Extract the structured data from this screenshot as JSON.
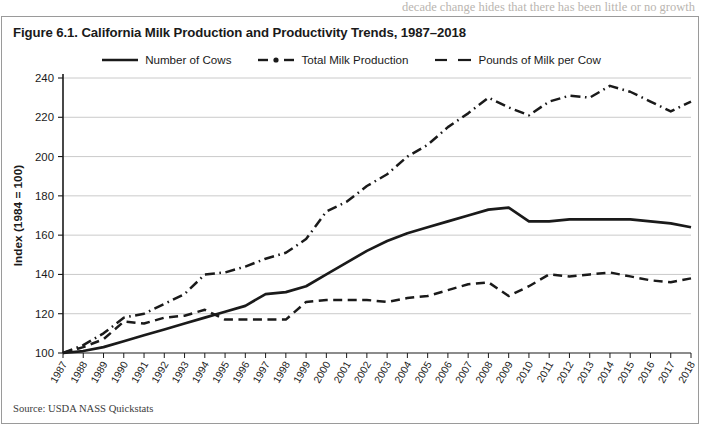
{
  "page_bleed_text": "decade change hides that there has been little or no growth",
  "figure": {
    "title": "Figure 6.1. California Milk Production and Productivity Trends, 1987–2018",
    "source": "Source: USDA NASS Quickstats",
    "border_color": "#9a9a9a",
    "background": "#ffffff"
  },
  "legend": {
    "position": "top-center",
    "items": [
      {
        "label": "Number of Cows",
        "style": "solid",
        "color": "#1a1a1a",
        "icon": "solid-line-swatch"
      },
      {
        "label": "Total Milk Production",
        "style": "dashdot",
        "color": "#1a1a1a",
        "icon": "dash-dot-line-swatch"
      },
      {
        "label": "Pounds of Milk per Cow",
        "style": "dashed",
        "color": "#1a1a1a",
        "icon": "dashed-line-swatch"
      }
    ]
  },
  "chart_data": {
    "type": "line",
    "title": "Figure 6.1. California Milk Production and Productivity Trends, 1987–2018",
    "xlabel": "",
    "ylabel": "Index (1984 = 100)",
    "ylim": [
      100,
      240
    ],
    "yticks": [
      100,
      120,
      140,
      160,
      180,
      200,
      220,
      240
    ],
    "grid": "horizontal",
    "legend_position": "top-center",
    "source": "Source: USDA NASS Quickstats",
    "categories": [
      "1987",
      "1988",
      "1989",
      "1990",
      "1991",
      "1992",
      "1993",
      "1994",
      "1995",
      "1996",
      "1997",
      "1998",
      "1999",
      "2000",
      "2001",
      "2002",
      "2003",
      "2004",
      "2005",
      "2006",
      "2007",
      "2008",
      "2009",
      "2010",
      "2011",
      "2012",
      "2013",
      "2014",
      "2015",
      "2016",
      "2017",
      "2018"
    ],
    "series": [
      {
        "name": "Number of Cows",
        "style": "solid",
        "color": "#1a1a1a",
        "values": [
          100,
          101,
          103,
          106,
          109,
          112,
          115,
          118,
          121,
          124,
          130,
          131,
          134,
          140,
          146,
          152,
          157,
          161,
          164,
          167,
          170,
          173,
          174,
          167,
          167,
          168,
          168,
          168,
          168,
          167,
          166,
          164
        ]
      },
      {
        "name": "Total Milk Production",
        "style": "dashdot",
        "color": "#1a1a1a",
        "values": [
          100,
          104,
          110,
          118,
          120,
          125,
          130,
          140,
          141,
          144,
          148,
          151,
          158,
          172,
          177,
          185,
          191,
          200,
          206,
          215,
          222,
          230,
          225,
          221,
          228,
          231,
          230,
          236,
          233,
          228,
          223,
          228
        ]
      },
      {
        "name": "Pounds of Milk per Cow",
        "style": "dashed",
        "color": "#1a1a1a",
        "values": [
          100,
          103,
          107,
          116,
          115,
          118,
          119,
          122,
          117,
          117,
          117,
          117,
          126,
          127,
          127,
          127,
          126,
          128,
          129,
          132,
          135,
          136,
          129,
          134,
          140,
          139,
          140,
          141,
          139,
          137,
          136,
          138
        ]
      }
    ]
  }
}
